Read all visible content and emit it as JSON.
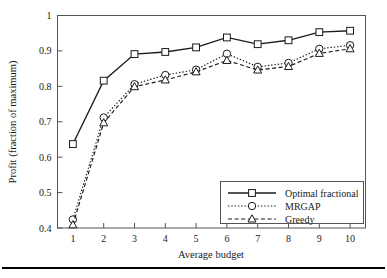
{
  "chart_data": {
    "type": "line",
    "title": "",
    "xlabel": "Average budget",
    "ylabel": "Profit (fraction of maximum)",
    "x": [
      1,
      2,
      3,
      4,
      5,
      6,
      7,
      8,
      9,
      10
    ],
    "xticklabels": [
      "1",
      "2",
      "3",
      "4",
      "5",
      "6",
      "7",
      "8",
      "9",
      "10"
    ],
    "yticklabels": [
      "0.4",
      "0.5",
      "0.6",
      "0.7",
      "0.8",
      "0.9",
      "1"
    ],
    "yticks": [
      0.4,
      0.5,
      0.6,
      0.7,
      0.8,
      0.9,
      1
    ],
    "xlim": [
      0.5,
      10.5
    ],
    "ylim": [
      0.4,
      1.0
    ],
    "grid": false,
    "legend_position": "lower right",
    "series": [
      {
        "name": "Optimal fractional",
        "marker": "square",
        "linestyle": "solid",
        "values": [
          0.637,
          0.816,
          0.891,
          0.897,
          0.91,
          0.938,
          0.919,
          0.93,
          0.953,
          0.957
        ]
      },
      {
        "name": "MRGAP",
        "marker": "circle",
        "linestyle": "dotted",
        "values": [
          0.424,
          0.712,
          0.806,
          0.832,
          0.847,
          0.892,
          0.855,
          0.866,
          0.906,
          0.916
        ]
      },
      {
        "name": "Greedy",
        "marker": "triangle",
        "linestyle": "dashed",
        "values": [
          0.409,
          0.697,
          0.799,
          0.818,
          0.841,
          0.873,
          0.846,
          0.856,
          0.893,
          0.906
        ]
      }
    ]
  },
  "legend": {
    "items": [
      {
        "label": "Optimal fractional"
      },
      {
        "label": "MRGAP"
      },
      {
        "label": "Greedy"
      }
    ]
  },
  "axes": {
    "x_title": "Average budget",
    "y_title": "Profit (fraction of maximum)"
  }
}
